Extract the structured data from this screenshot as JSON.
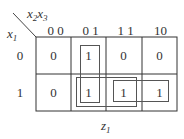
{
  "kmap": {
    "row_var": "x",
    "row_var_sub": "1",
    "col_var_a": "x",
    "col_var_a_sub": "2",
    "col_var_b": "x",
    "col_var_b_sub": "3",
    "col_labels": [
      "0 0",
      "0 1",
      "1 1",
      "10"
    ],
    "row_labels": [
      "0",
      "1"
    ],
    "cells": [
      [
        "0",
        "1",
        "0",
        "0"
      ],
      [
        "0",
        "1",
        "1",
        "1"
      ]
    ],
    "groups": [
      {
        "name": "column-01-pair",
        "cells": "row0-col01,row1-col01"
      },
      {
        "name": "row1-01-11-pair",
        "cells": "row1-col01,row1-col11"
      },
      {
        "name": "row1-11-10-pair",
        "cells": "row1-col11,row1-col10"
      }
    ],
    "caption": "z",
    "caption_sub": "1"
  }
}
